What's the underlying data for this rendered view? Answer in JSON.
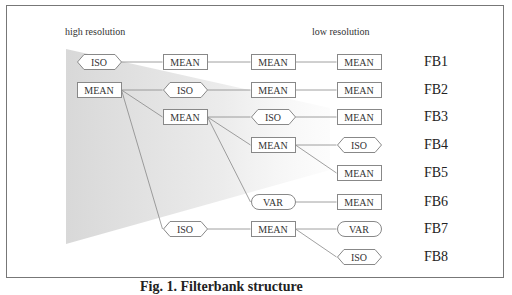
{
  "diagram": {
    "labels": {
      "high_resolution": "high resolution",
      "low_resolution": "low resolution"
    },
    "filterbanks": [
      "FB1",
      "FB2",
      "FB3",
      "FB4",
      "FB5",
      "FB6",
      "FB7",
      "FB8"
    ],
    "nodes": [
      {
        "id": "c1r1",
        "col": 1,
        "row": 1,
        "type": "ISO",
        "shape": "hexagon"
      },
      {
        "id": "c1r2",
        "col": 1,
        "row": 2,
        "type": "MEAN",
        "shape": "rect"
      },
      {
        "id": "c2r1",
        "col": 2,
        "row": 1,
        "type": "MEAN",
        "shape": "rect"
      },
      {
        "id": "c2r2",
        "col": 2,
        "row": 2,
        "type": "ISO",
        "shape": "hexagon"
      },
      {
        "id": "c2r3",
        "col": 2,
        "row": 3,
        "type": "MEAN",
        "shape": "rect"
      },
      {
        "id": "c2r7",
        "col": 2,
        "row": 7,
        "type": "ISO",
        "shape": "hexagon"
      },
      {
        "id": "c3r1",
        "col": 3,
        "row": 1,
        "type": "MEAN",
        "shape": "rect"
      },
      {
        "id": "c3r2",
        "col": 3,
        "row": 2,
        "type": "MEAN",
        "shape": "rect"
      },
      {
        "id": "c3r3",
        "col": 3,
        "row": 3,
        "type": "ISO",
        "shape": "hexagon"
      },
      {
        "id": "c3r4",
        "col": 3,
        "row": 4,
        "type": "MEAN",
        "shape": "rect"
      },
      {
        "id": "c3r6",
        "col": 3,
        "row": 6,
        "type": "VAR",
        "shape": "pill"
      },
      {
        "id": "c3r7",
        "col": 3,
        "row": 7,
        "type": "MEAN",
        "shape": "rect"
      },
      {
        "id": "c4r1",
        "col": 4,
        "row": 1,
        "type": "MEAN",
        "shape": "rect"
      },
      {
        "id": "c4r2",
        "col": 4,
        "row": 2,
        "type": "MEAN",
        "shape": "rect"
      },
      {
        "id": "c4r3",
        "col": 4,
        "row": 3,
        "type": "MEAN",
        "shape": "rect"
      },
      {
        "id": "c4r4",
        "col": 4,
        "row": 4,
        "type": "ISO",
        "shape": "hexagon"
      },
      {
        "id": "c4r5",
        "col": 4,
        "row": 5,
        "type": "MEAN",
        "shape": "rect"
      },
      {
        "id": "c4r6",
        "col": 4,
        "row": 6,
        "type": "MEAN",
        "shape": "rect"
      },
      {
        "id": "c4r7",
        "col": 4,
        "row": 7,
        "type": "VAR",
        "shape": "pill"
      },
      {
        "id": "c4r8",
        "col": 4,
        "row": 8,
        "type": "ISO",
        "shape": "hexagon"
      }
    ],
    "edges": [
      [
        "c1r1",
        "c2r1"
      ],
      [
        "c2r1",
        "c3r1"
      ],
      [
        "c3r1",
        "c4r1"
      ],
      [
        "c1r2",
        "c2r2"
      ],
      [
        "c2r2",
        "c3r2"
      ],
      [
        "c3r2",
        "c4r2"
      ],
      [
        "c1r2",
        "c2r3"
      ],
      [
        "c2r3",
        "c3r3"
      ],
      [
        "c3r3",
        "c4r3"
      ],
      [
        "c2r3",
        "c3r4"
      ],
      [
        "c3r4",
        "c4r4"
      ],
      [
        "c3r4",
        "c4r5"
      ],
      [
        "c2r3",
        "c3r6"
      ],
      [
        "c3r6",
        "c4r6"
      ],
      [
        "c1r2",
        "c2r7"
      ],
      [
        "c2r7",
        "c3r7"
      ],
      [
        "c3r7",
        "c4r7"
      ],
      [
        "c3r7",
        "c4r8"
      ]
    ]
  },
  "caption": "Fig. 1. Filterbank structure"
}
